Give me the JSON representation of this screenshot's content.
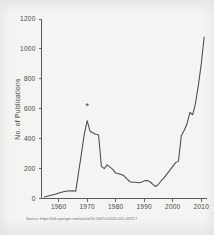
{
  "source_note": "Source: https://link.springer.com/article/10.1007/s12011-015-0373-7",
  "chart_data": {
    "type": "line",
    "title": "",
    "xlabel": "",
    "ylabel": "No. of Publications",
    "xlim": [
      1954,
      2012
    ],
    "ylim": [
      0,
      1200
    ],
    "xticks": [
      1960,
      1970,
      1980,
      1990,
      2000,
      2010
    ],
    "xtick_labels": [
      "1960",
      "1970",
      "1980",
      "1990",
      "2000",
      "2010"
    ],
    "yticks": [
      0,
      200,
      400,
      600,
      800,
      1000,
      1200
    ],
    "ytick_labels": [
      "0",
      "200",
      "400",
      "600",
      "800",
      "1000",
      "1200"
    ],
    "grid": false,
    "legend": false,
    "line_color": "#4b4b49",
    "annotations": [
      {
        "label": "*",
        "x": 1970,
        "y": 600,
        "name": "asterisk-annotation"
      }
    ],
    "series": [
      {
        "name": "No. of Publications",
        "x": [
          1955,
          1957,
          1959,
          1961,
          1963,
          1965,
          1966,
          1967,
          1968,
          1969,
          1970,
          1971,
          1972,
          1973,
          1974,
          1975,
          1976,
          1977,
          1978,
          1979,
          1980,
          1981,
          1982,
          1983,
          1984,
          1985,
          1986,
          1987,
          1988,
          1989,
          1990,
          1991,
          1992,
          1993,
          1994,
          1995,
          1996,
          1997,
          1998,
          1999,
          2000,
          2001,
          2002,
          2003,
          2004,
          2005,
          2006,
          2007,
          2008,
          2009,
          2010,
          2011
        ],
        "values": [
          10,
          20,
          30,
          42,
          50,
          52,
          48,
          175,
          300,
          430,
          520,
          450,
          440,
          430,
          425,
          215,
          200,
          225,
          210,
          195,
          170,
          165,
          160,
          150,
          130,
          112,
          108,
          108,
          105,
          108,
          118,
          120,
          112,
          95,
          80,
          95,
          120,
          140,
          165,
          190,
          215,
          240,
          250,
          420,
          455,
          500,
          575,
          560,
          640,
          760,
          900,
          1080
        ]
      }
    ]
  }
}
